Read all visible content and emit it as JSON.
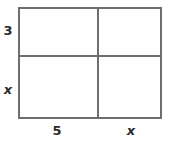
{
  "figure": {
    "type": "area-model-rectangle",
    "colors": {
      "line": "#6e6e6e",
      "text": "#2b2b2b",
      "background": "#ffffff"
    },
    "labels": {
      "left_top": "3",
      "left_bottom": "x",
      "bottom_left": "5",
      "bottom_right": "x"
    },
    "dimensions": {
      "vertical_segments": [
        "3",
        "x"
      ],
      "horizontal_segments": [
        "5",
        "x"
      ]
    }
  }
}
